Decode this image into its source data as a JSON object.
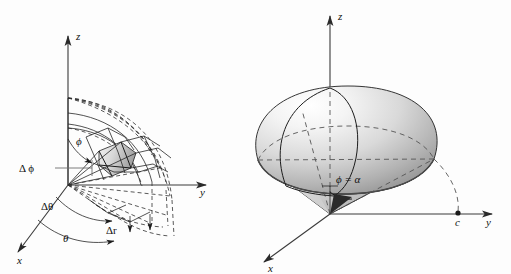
{
  "figure": {
    "background_color": "#fdfdfd",
    "ink_color": "#1c1c1c",
    "panels": [
      {
        "id": "left",
        "name": "spherical-volume-element",
        "description": "Spherical coordinate volume element wedge",
        "axes": [
          {
            "name": "z",
            "label": "z",
            "direction": "up"
          },
          {
            "name": "y",
            "label": "y",
            "direction": "right"
          },
          {
            "name": "x",
            "label": "x",
            "direction": "down-left"
          }
        ],
        "labels": [
          {
            "name": "delta-phi",
            "text": "Δ ϕ"
          },
          {
            "name": "delta-theta",
            "text": "Δθ"
          },
          {
            "name": "delta-r",
            "text": "Δr"
          },
          {
            "name": "theta",
            "text": "θ"
          },
          {
            "name": "phi",
            "text": "ϕ"
          }
        ]
      },
      {
        "id": "right",
        "name": "ice-cream-cone-solid",
        "description": "Sphere cap atop a cone, phi equals alpha",
        "axes": [
          {
            "name": "z",
            "label": "z",
            "direction": "up"
          },
          {
            "name": "y",
            "label": "y",
            "direction": "right"
          },
          {
            "name": "x",
            "label": "x",
            "direction": "down-left"
          }
        ],
        "labels": [
          {
            "name": "phi-equals-alpha",
            "text": "ϕ = α"
          },
          {
            "name": "point-c",
            "text": "c"
          }
        ]
      }
    ]
  }
}
